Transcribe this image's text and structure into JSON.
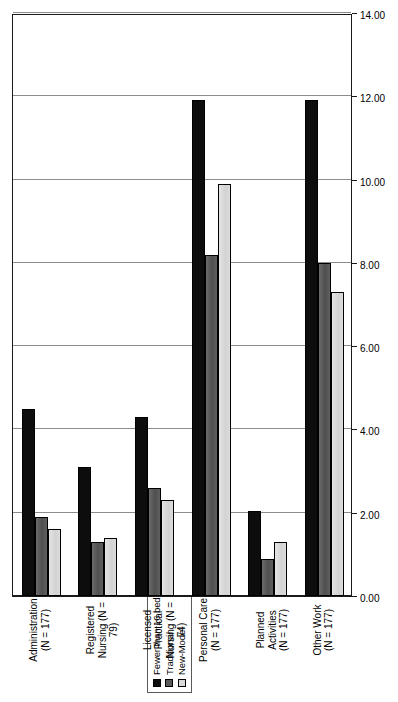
{
  "chart_data": {
    "type": "bar",
    "orientation": "rotated-vertical",
    "title": "",
    "subtitle": "",
    "xlabel": "",
    "ylabel": "",
    "ylim": [
      0,
      14
    ],
    "ytick_step": 2,
    "grid": true,
    "legend_position": "top-left",
    "tick_labels": [
      "0.00",
      "2.00",
      "4.00",
      "6.00",
      "8.00",
      "10.00",
      "12.00",
      "14.00"
    ],
    "tick_values": [
      0,
      2,
      4,
      6,
      8,
      10,
      12,
      14
    ],
    "categories": [
      "Administration\n(N = 177)",
      "Registered\nNursing  (N = 79)",
      "Licensed Practical\nNursing (N = 74)",
      "Personal Care\n(N = 177)",
      "Planned Activities\n(N = 177)",
      "Other Work\n(N = 177)"
    ],
    "series": [
      {
        "name": "Fewer than 16 beds",
        "color": "#0d0d0d",
        "values": [
          4.5,
          3.1,
          4.3,
          11.9,
          2.05,
          11.9
        ]
      },
      {
        "name": "Traditional",
        "color": "#595959",
        "values": [
          1.9,
          1.3,
          2.6,
          8.2,
          0.9,
          8.0
        ]
      },
      {
        "name": "New-Model",
        "color": "#d9d9d9",
        "values": [
          1.6,
          1.4,
          2.3,
          9.9,
          1.3,
          7.3
        ]
      }
    ]
  },
  "legend": {
    "items": [
      {
        "label": "Fewer than 16 beds",
        "color": "#0d0d0d"
      },
      {
        "label": "Traditional",
        "color": "#595959"
      },
      {
        "label": "New-Model",
        "color": "#d9d9d9"
      }
    ]
  }
}
